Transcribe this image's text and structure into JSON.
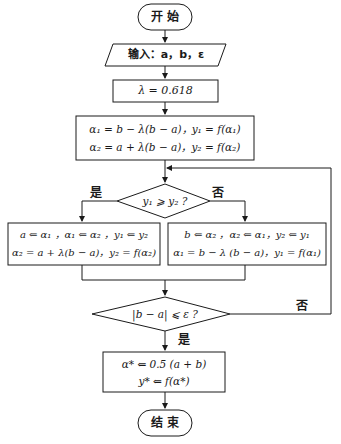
{
  "flowchart": {
    "title": "Golden section search flowchart",
    "start": {
      "label": "开  始"
    },
    "input": {
      "label": "输入：a，b，ε"
    },
    "lambda": {
      "label": "λ = 0.618"
    },
    "init": {
      "line1": "α₁ = b − λ(b − a)，y₁ = f(α₁)",
      "line2": "α₂ = a + λ(b − a)，y₂ = f(α₂)"
    },
    "decision1": {
      "label": "y₁ ⩾ y₂ ?",
      "yes_label": "是",
      "no_label": "否"
    },
    "left_box": {
      "line1": "a ⇐ α₁ ，α₁ ⇐ α₂ ，y₁ ⇐ y₂",
      "line2": "α₂ = a + λ(b − a)，y₂ = f(α₂)"
    },
    "right_box": {
      "line1": "b ⇐ α₂ ，α₂ ⇐ α₁，y₂ ⇐ y₁",
      "line2": "α₁ = b − λ (b − a)，y₁ = f(α₁)"
    },
    "decision2": {
      "label": "|b − a| ⩽ ε ?",
      "yes_label": "是",
      "no_label": "否"
    },
    "result": {
      "line1": "α* ⇐ 0.5 (a + b)",
      "line2": "y* ⇐ f(α*)"
    },
    "end": {
      "label": "结  束"
    }
  }
}
